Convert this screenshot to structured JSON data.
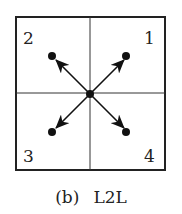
{
  "diagram": {
    "quadrant_labels": [
      "1",
      "2",
      "3",
      "4"
    ],
    "caption": {
      "sublabel": "(b)",
      "title": "L2L"
    },
    "colors": {
      "line": "#222222",
      "background": "#ffffff"
    }
  }
}
